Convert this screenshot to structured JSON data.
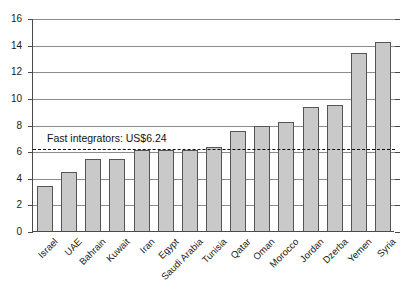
{
  "chart_data": {
    "type": "bar",
    "title": "",
    "subtitle": "",
    "xlabel": "",
    "ylabel": "",
    "ylim": [
      0,
      16
    ],
    "ytick_values": [
      0,
      2,
      4,
      6,
      8,
      10,
      12,
      14,
      16
    ],
    "ytick_labels": [
      "0",
      "2",
      "4",
      "6",
      "8",
      "10",
      "12",
      "14",
      "16"
    ],
    "grid": true,
    "legend": "none",
    "categories": [
      "Israel",
      "UAE",
      "Bahrain",
      "Kuwait",
      "Iran",
      "Egypt",
      "Saudi Arabia",
      "Tunisia",
      "Qatar",
      "Oman",
      "Morocco",
      "Jordan",
      "Dzerba",
      "Yemen",
      "Syria"
    ],
    "values": [
      3.4,
      4.4,
      5.4,
      5.4,
      6.1,
      6.1,
      6.1,
      6.3,
      7.5,
      7.9,
      8.2,
      9.3,
      9.45,
      13.4,
      14.2
    ],
    "annotations": [
      {
        "type": "hline",
        "name": "fast-integrators-reference",
        "value": 6.24,
        "label": "Fast integrators: US$6.24",
        "style": "dashed"
      }
    ]
  },
  "colors": {
    "bar_fill": "#c9c9c9",
    "bar_stroke": "#555555",
    "gridline": "#8c8c8c",
    "axis": "#4a4a4a",
    "text": "#1a1a1a",
    "reference_line": "#111111",
    "background": "#ffffff"
  }
}
